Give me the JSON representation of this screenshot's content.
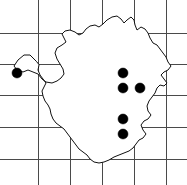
{
  "figure": {
    "type": "dot-distribution-map",
    "width": 187,
    "height": 185,
    "background_color": "#ffffff"
  },
  "grid": {
    "label": "Grid overlay",
    "line_color": "#4a4a4a",
    "line_width": 1,
    "vertical_lines_x": [
      38,
      70,
      102,
      134,
      166
    ],
    "horizontal_lines_y": [
      33,
      64,
      95,
      127,
      159
    ],
    "cell_size_px": 32
  },
  "region": {
    "label": "Country outline",
    "outline_color": "#111111",
    "fill_color": "#ffffff",
    "path": "M 36 61 L 30 55 L 24 55 L 18 60 L 14 66 L 17 70 L 23 72 L 28 70 L 33 72 L 38 74 L 42 79 L 46 82 L 52 83 L 57 81 L 61 78 L 64 74 L 63 69 L 60 64 L 57 59 L 55 53 L 57 48 L 62 45 L 66 42 L 64 38 L 62 34 L 65 31 L 70 30 L 75 32 L 79 35 L 83 33 L 86 29 L 90 26 L 95 25 L 99 27 L 103 24 L 107 20 L 112 17 L 117 16 L 121 19 L 124 23 L 127 20 L 131 17 L 134 20 L 135 25 L 137 30 L 141 27 L 145 29 L 148 33 L 150 38 L 153 43 L 157 45 L 160 49 L 163 53 L 166 57 L 168 62 L 171 66 L 168 70 L 164 72 L 161 75 L 164 79 L 167 83 L 164 86 L 160 85 L 157 88 L 155 93 L 152 97 L 149 101 L 147 106 L 148 111 L 151 115 L 148 119 L 144 121 L 141 125 L 143 130 L 146 134 L 143 138 L 139 140 L 136 144 L 133 148 L 129 151 L 124 153 L 119 155 L 114 157 L 109 160 L 104 162 L 99 163 L 94 162 L 90 159 L 87 155 L 83 152 L 79 149 L 76 145 L 73 141 L 70 137 L 67 133 L 64 129 L 60 126 L 56 123 L 53 119 L 51 114 L 50 109 L 48 105 L 45 101 L 43 96 L 42 91 L 44 87 L 46 83 L 43 79 L 40 75 L 38 70 L 39 65 Z"
  },
  "occurrences": {
    "label": "Occurrence records",
    "dot_color": "#000000",
    "dot_radius": 5,
    "count": 6,
    "points": [
      {
        "name": "record-1",
        "x": 17,
        "y": 73
      },
      {
        "name": "record-2",
        "x": 123,
        "y": 73
      },
      {
        "name": "record-3",
        "x": 123,
        "y": 88
      },
      {
        "name": "record-4",
        "x": 140,
        "y": 88
      },
      {
        "name": "record-5",
        "x": 123,
        "y": 119
      },
      {
        "name": "record-6",
        "x": 123,
        "y": 134
      }
    ]
  },
  "chart_data": {
    "type": "scatter",
    "xlabel": "",
    "ylabel": "",
    "xlim": [
      0,
      187
    ],
    "ylim": [
      0,
      185
    ],
    "grid": true,
    "legend": "none",
    "series": [
      {
        "name": "Occurrence records",
        "marker": "filled-circle",
        "color": "#000000",
        "x": [
          17,
          123,
          123,
          140,
          123,
          123
        ],
        "y": [
          73,
          73,
          88,
          88,
          119,
          134
        ]
      }
    ],
    "annotations": [
      "Country boundary outline drawn as polyline",
      "Uniform square grid overlay, 32 px cells"
    ]
  }
}
